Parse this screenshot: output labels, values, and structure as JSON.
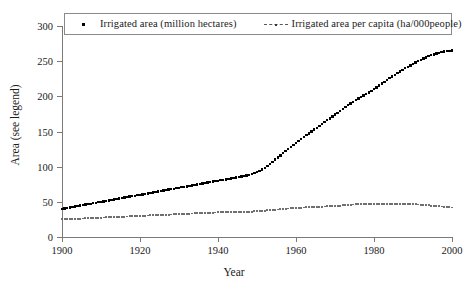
{
  "chart_data": {
    "type": "scatter",
    "title": "",
    "xlabel": "Year",
    "ylabel": "Area (see legend)",
    "xlim": [
      1900,
      2000
    ],
    "ylim": [
      0,
      300
    ],
    "xticks": [
      1900,
      1920,
      1940,
      1960,
      1980,
      2000
    ],
    "yticks": [
      0,
      50,
      100,
      150,
      200,
      250,
      300
    ],
    "grid": false,
    "legend_position": "top",
    "legend": [
      "Irrigated area (million hectares)",
      "Irrigated area per capita (ha/000people)"
    ],
    "x": [
      1900,
      1902,
      1904,
      1906,
      1908,
      1910,
      1912,
      1914,
      1916,
      1918,
      1920,
      1922,
      1924,
      1926,
      1928,
      1930,
      1932,
      1934,
      1936,
      1938,
      1940,
      1942,
      1944,
      1946,
      1948,
      1950,
      1952,
      1954,
      1956,
      1958,
      1960,
      1962,
      1964,
      1966,
      1968,
      1970,
      1972,
      1974,
      1976,
      1978,
      1980,
      1982,
      1984,
      1986,
      1988,
      1990,
      1992,
      1994,
      1996,
      1998,
      2000
    ],
    "series": [
      {
        "name": "Irrigated area (million hectares)",
        "marker": "square-dot",
        "color": "#000000",
        "values": [
          40,
          42,
          44,
          46,
          48,
          50,
          52,
          54,
          56,
          58,
          60,
          62,
          64,
          66,
          68,
          70,
          72,
          74,
          76,
          78,
          80,
          82,
          84,
          86,
          88,
          92,
          98,
          107,
          116,
          125,
          134,
          142,
          150,
          158,
          166,
          174,
          182,
          190,
          197,
          203,
          210,
          218,
          226,
          233,
          240,
          246,
          252,
          257,
          261,
          264,
          265
        ]
      },
      {
        "name": "Irrigated area per capita (ha/000people)",
        "marker": "dotted-line",
        "color": "#6f6f6f",
        "values": [
          25,
          25.5,
          26,
          26.5,
          27,
          27.5,
          28,
          28.5,
          29,
          29.5,
          30,
          30.5,
          31,
          31.5,
          32,
          32.5,
          33,
          33.5,
          34,
          34.5,
          35,
          35.2,
          35.5,
          35.8,
          36,
          36.5,
          37.5,
          38.5,
          39.5,
          40.5,
          41.5,
          42,
          42.5,
          43,
          43.5,
          44,
          45,
          46,
          46.5,
          47,
          47.5,
          47.5,
          47.5,
          47,
          47,
          46.5,
          46,
          45,
          44,
          43,
          42
        ]
      }
    ]
  },
  "axis": {
    "y_title": "Area (see legend)",
    "x_title": "Year",
    "y_tick_labels": [
      "300",
      "250",
      "200",
      "150",
      "100",
      "50",
      "0"
    ],
    "x_tick_labels": [
      "1900",
      "1920",
      "1940",
      "1960",
      "1980",
      "2000"
    ]
  },
  "legend_box": {
    "entry1_label": "Irrigated area (million hectares)",
    "entry2_label": "Irrigated area per capita (ha/000people)"
  },
  "colors": {
    "series1": "#000000",
    "series2": "#6f6f6f",
    "axis": "#7a7a7a",
    "text": "#1a1a1a",
    "legend_border": "#8a8a8a",
    "background": "#ffffff"
  }
}
